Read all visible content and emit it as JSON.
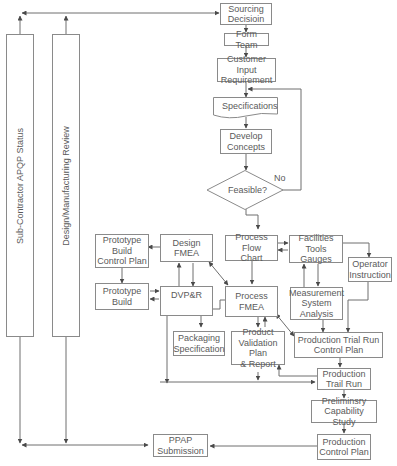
{
  "side_bars": {
    "subcontractor": "Sub-Contractor APQP Status",
    "design_review": "Design/Manufacturing Review"
  },
  "nodes": {
    "sourcing": "Sourcing\nDecisioin",
    "form_team": "Form Team",
    "customer_input": "Customer Input\nRequirement",
    "specifications": "Specifications",
    "develop_concepts": "Develop\nConcepts",
    "feasible": "Feasible?",
    "prototype_build_control_plan": "Prototype\nBuild\nControl Plan",
    "design_fmea": "Design FMEA",
    "process_flow_chart": "Process Flow\nChart",
    "facilities": "Facilities\nTools Gauges",
    "operator_instruction": "Operator\nInstruction",
    "prototype_build": "Prototype\nBuild",
    "dvpr": "DVP&R",
    "process_fmea": "Process\nFMEA",
    "msa": "Measurement\nSystem\nAnalysis",
    "packaging_spec": "Packaging\nSpecification",
    "product_validation": "Product\nValidation Plan\n& Report",
    "production_trial_run_cp": "Production Trial Run\nControl Plan",
    "production_trail_run": "Production\nTrail Run",
    "preliminary_capability": "Preliminsry\nCapability Study",
    "ppap": "PPAP\nSubmission",
    "production_control_plan": "Production\nControl Plan"
  },
  "edge_labels": {
    "no": "No"
  },
  "colors": {
    "line": "#6e6e6e",
    "border": "#8a8a8a",
    "text": "#5a5a5a"
  }
}
